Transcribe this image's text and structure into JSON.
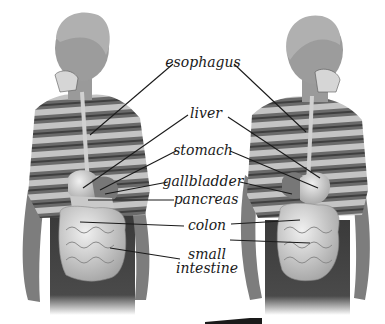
{
  "figure": {
    "subjects": [
      "left-boy-figure",
      "right-boy-figure"
    ],
    "colors": {
      "background": "#ffffff",
      "shirt_light": "#bdbdbd",
      "shirt_dark": "#5a5a5a",
      "skin": "#8a8a8a",
      "pants": "#3a3a3a",
      "organ": "#d9d9d9",
      "leader_line": "#1a1a1a"
    }
  },
  "labels": [
    {
      "id": "esophagus",
      "text": "esophagus",
      "x": 203,
      "y": 62
    },
    {
      "id": "liver",
      "text": "liver",
      "x": 206,
      "y": 113
    },
    {
      "id": "stomach",
      "text": "stomach",
      "x": 203,
      "y": 150
    },
    {
      "id": "gallbladder",
      "text": "gallbladder",
      "x": 203,
      "y": 181
    },
    {
      "id": "pancreas",
      "text": "pancreas",
      "x": 206,
      "y": 199
    },
    {
      "id": "colon",
      "text": "colon",
      "x": 207,
      "y": 225
    },
    {
      "id": "small_intestine",
      "text_line1": "small",
      "text_line2": "intestine",
      "x": 207,
      "y": 261
    }
  ]
}
